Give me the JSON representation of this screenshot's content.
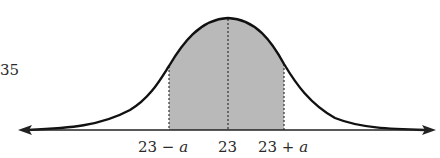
{
  "diagram": {
    "type": "normal-distribution",
    "side_label": "35",
    "mean": 23,
    "tick_labels": [
      {
        "text": "23 − a",
        "prefix": "23 − ",
        "var": "a"
      },
      {
        "text": "23",
        "prefix": "23",
        "var": ""
      },
      {
        "text": "23 + a",
        "prefix": "23 + ",
        "var": "a"
      }
    ],
    "shaded_region": {
      "from": "23 − a",
      "to": "23 + a"
    },
    "colors": {
      "curve": "#111111",
      "shade": "#b9b9b9",
      "axis": "#222222"
    }
  }
}
